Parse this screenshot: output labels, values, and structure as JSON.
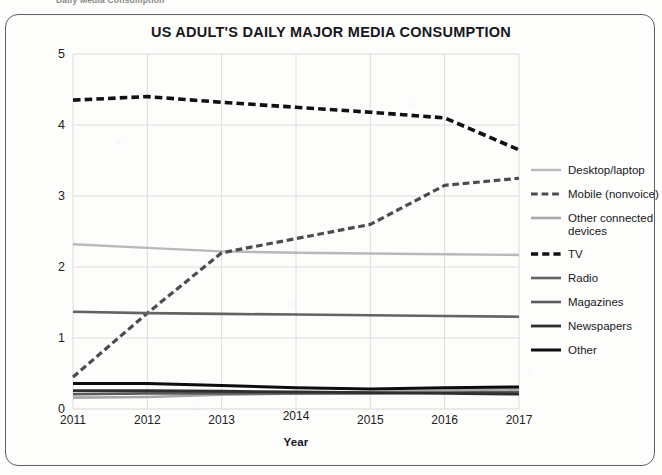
{
  "page": {
    "caption_partial": "Daily Media Consumption"
  },
  "chart_data": {
    "type": "line",
    "title": "US ADULT'S DAILY MAJOR MEDIA CONSUMPTION",
    "xlabel": "Year",
    "ylabel": "",
    "categories": [
      "2011",
      "2012",
      "2013",
      "2014",
      "2015",
      "2016",
      "2017"
    ],
    "x": [
      2011,
      2012,
      2013,
      2014,
      2015,
      2016,
      2017
    ],
    "xlim": [
      2011,
      2017
    ],
    "ylim": [
      0,
      5
    ],
    "y_ticks": [
      "0",
      "1",
      "2",
      "3",
      "4",
      "5"
    ],
    "grid": true,
    "legend_position": "right",
    "series": [
      {
        "name": "Desktop/laptop",
        "values": [
          2.32,
          2.27,
          2.22,
          2.2,
          2.19,
          2.18,
          2.17
        ],
        "color": "#b9b9b9",
        "style": "solid",
        "width": 2.4
      },
      {
        "name": "Mobile (nonvoice)",
        "values": [
          0.45,
          1.35,
          2.2,
          2.4,
          2.6,
          3.15,
          3.25
        ],
        "color": "#4c4c4c",
        "style": "dashed",
        "width": 3.2
      },
      {
        "name": "Other connected devices",
        "values": [
          0.16,
          0.17,
          0.2,
          0.22,
          0.24,
          0.26,
          0.28
        ],
        "color": "#a8a8a8",
        "style": "solid",
        "width": 2.6
      },
      {
        "name": "TV",
        "values": [
          4.35,
          4.4,
          4.32,
          4.25,
          4.18,
          4.1,
          3.65
        ],
        "color": "#111111",
        "style": "dashed",
        "width": 3.6
      },
      {
        "name": "Radio",
        "values": [
          1.37,
          1.35,
          1.34,
          1.33,
          1.32,
          1.31,
          1.3
        ],
        "color": "#636363",
        "style": "solid",
        "width": 2.6
      },
      {
        "name": "Magazines",
        "values": [
          0.21,
          0.22,
          0.22,
          0.22,
          0.22,
          0.23,
          0.24
        ],
        "color": "#5a5a5a",
        "style": "solid",
        "width": 2.6
      },
      {
        "name": "Newspapers",
        "values": [
          0.26,
          0.26,
          0.25,
          0.24,
          0.23,
          0.22,
          0.21
        ],
        "color": "#2e2e2e",
        "style": "solid",
        "width": 2.8
      },
      {
        "name": "Other",
        "values": [
          0.36,
          0.36,
          0.33,
          0.3,
          0.28,
          0.3,
          0.31
        ],
        "color": "#0d0d0d",
        "style": "solid",
        "width": 3.0
      }
    ]
  },
  "colors": {
    "frame": "#5d6067",
    "grid": "#d8d8d8",
    "text": "#17191d"
  }
}
